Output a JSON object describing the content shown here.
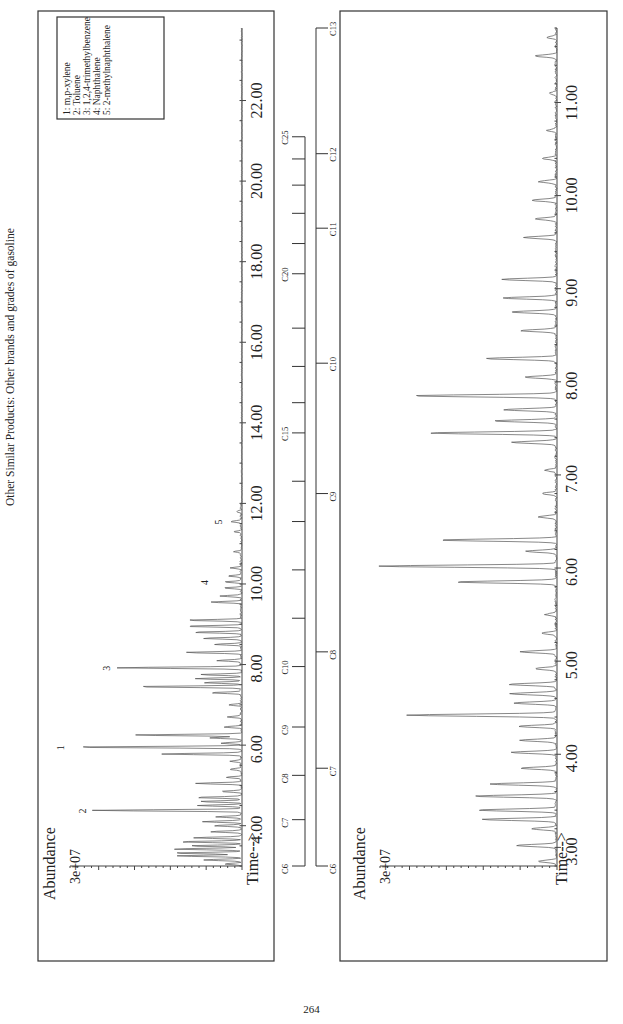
{
  "page": {
    "title": "Other Similar Products:   Other brands and grades of gasoline",
    "page_number": "264"
  },
  "chart_data": [
    {
      "type": "line",
      "id": "top-chromatogram",
      "title": "",
      "ylabel": "Abundance",
      "y_tick_label": "3e+07",
      "xlabel": "Time-->",
      "xlim": [
        3.0,
        23.8
      ],
      "x_ticks": [
        4.0,
        6.0,
        8.0,
        10.0,
        12.0,
        14.0,
        16.0,
        18.0,
        20.0,
        22.0
      ],
      "x_tick_labels": [
        "4.00",
        "6.00",
        "8.00",
        "10.00",
        "12.00",
        "14.00",
        "16.00",
        "18.00",
        "20.00",
        "22.00"
      ],
      "grid": false,
      "legend": {
        "position": "upper-left (rotated page)",
        "entries": [
          "1:  m,p-xylene",
          "2:  Toluene",
          "3:  1,2,4-trimethylbenzene",
          "4:  Naphthalene",
          "5:  2-methylnaphthalene"
        ]
      },
      "peak_annotations": [
        {
          "label": "1",
          "x": 5.95,
          "rel_height": 1.0
        },
        {
          "label": "2",
          "x": 4.38,
          "rel_height": 0.87
        },
        {
          "label": "3",
          "x": 7.92,
          "rel_height": 0.73
        },
        {
          "label": "4",
          "x": 10.05,
          "rel_height": 0.16
        },
        {
          "label": "5",
          "x": 11.55,
          "rel_height": 0.08
        }
      ],
      "peaks": [
        [
          3.05,
          0.1
        ],
        [
          3.15,
          0.22
        ],
        [
          3.25,
          0.38
        ],
        [
          3.32,
          0.4
        ],
        [
          3.42,
          0.4
        ],
        [
          3.5,
          0.3
        ],
        [
          3.6,
          0.36
        ],
        [
          3.7,
          0.28
        ],
        [
          3.85,
          0.18
        ],
        [
          4.0,
          0.16
        ],
        [
          4.1,
          0.22
        ],
        [
          4.22,
          0.15
        ],
        [
          4.38,
          0.87
        ],
        [
          4.5,
          0.25
        ],
        [
          4.6,
          0.24
        ],
        [
          4.7,
          0.27
        ],
        [
          4.85,
          0.12
        ],
        [
          5.05,
          0.27
        ],
        [
          5.2,
          0.09
        ],
        [
          5.4,
          0.07
        ],
        [
          5.6,
          0.06
        ],
        [
          5.78,
          0.46
        ],
        [
          5.95,
          1.0
        ],
        [
          6.05,
          0.12
        ],
        [
          6.18,
          0.18
        ],
        [
          6.25,
          0.63
        ],
        [
          6.45,
          0.1
        ],
        [
          6.7,
          0.08
        ],
        [
          7.0,
          0.07
        ],
        [
          7.3,
          0.18
        ],
        [
          7.45,
          0.62
        ],
        [
          7.55,
          0.22
        ],
        [
          7.65,
          0.27
        ],
        [
          7.75,
          0.24
        ],
        [
          7.92,
          0.73
        ],
        [
          8.1,
          0.14
        ],
        [
          8.3,
          0.33
        ],
        [
          8.5,
          0.16
        ],
        [
          8.65,
          0.22
        ],
        [
          8.8,
          0.28
        ],
        [
          8.95,
          0.33
        ],
        [
          9.1,
          0.32
        ],
        [
          9.55,
          0.18
        ],
        [
          9.7,
          0.12
        ],
        [
          9.9,
          0.1
        ],
        [
          10.05,
          0.1
        ],
        [
          10.2,
          0.08
        ],
        [
          10.4,
          0.06
        ],
        [
          10.8,
          0.04
        ],
        [
          11.3,
          0.04
        ],
        [
          11.55,
          0.06
        ],
        [
          11.8,
          0.03
        ]
      ]
    },
    {
      "type": "line",
      "id": "bottom-chromatogram-expanded",
      "title": "",
      "ylabel": "Abundance",
      "y_tick_label": "3e+07",
      "xlabel": "Time-->",
      "xlim": [
        2.8,
        11.8
      ],
      "x_ticks": [
        3.0,
        4.0,
        5.0,
        6.0,
        7.0,
        8.0,
        9.0,
        10.0,
        11.0
      ],
      "x_tick_labels": [
        "3.00",
        "4.00",
        "5.00",
        "6.00",
        "7.00",
        "8.00",
        "9.00",
        "10.00",
        "11.00"
      ],
      "grid": false,
      "peaks": [
        [
          2.85,
          0.1
        ],
        [
          3.02,
          0.22
        ],
        [
          3.2,
          0.14
        ],
        [
          3.3,
          0.42
        ],
        [
          3.4,
          0.44
        ],
        [
          3.55,
          0.46
        ],
        [
          3.68,
          0.37
        ],
        [
          3.85,
          0.2
        ],
        [
          4.02,
          0.25
        ],
        [
          4.15,
          0.2
        ],
        [
          4.3,
          0.21
        ],
        [
          4.42,
          0.84
        ],
        [
          4.55,
          0.24
        ],
        [
          4.65,
          0.26
        ],
        [
          4.75,
          0.27
        ],
        [
          4.92,
          0.12
        ],
        [
          5.1,
          0.2
        ],
        [
          5.3,
          0.08
        ],
        [
          5.5,
          0.06
        ],
        [
          5.85,
          0.57
        ],
        [
          6.02,
          1.0
        ],
        [
          6.18,
          0.17
        ],
        [
          6.3,
          0.66
        ],
        [
          6.55,
          0.1
        ],
        [
          6.8,
          0.08
        ],
        [
          7.05,
          0.06
        ],
        [
          7.35,
          0.25
        ],
        [
          7.45,
          0.72
        ],
        [
          7.58,
          0.35
        ],
        [
          7.7,
          0.3
        ],
        [
          7.85,
          0.81
        ],
        [
          8.05,
          0.18
        ],
        [
          8.25,
          0.4
        ],
        [
          8.55,
          0.2
        ],
        [
          8.75,
          0.26
        ],
        [
          8.9,
          0.3
        ],
        [
          9.1,
          0.31
        ],
        [
          9.55,
          0.18
        ],
        [
          9.75,
          0.12
        ],
        [
          9.95,
          0.14
        ],
        [
          10.15,
          0.1
        ],
        [
          10.4,
          0.08
        ],
        [
          10.7,
          0.05
        ],
        [
          11.1,
          0.04
        ],
        [
          11.5,
          0.12
        ],
        [
          11.7,
          0.05
        ]
      ]
    }
  ],
  "ladders": {
    "long_range": {
      "labels": [
        "C6",
        "C7",
        "C8",
        "C9",
        "C10",
        "C15",
        "C20",
        "C25"
      ],
      "label_times": {
        "C6": 3.0,
        "C7": 4.15,
        "C8": 5.25,
        "C9": 6.45,
        "C10": 7.95,
        "C15": 13.75,
        "C20": 17.7,
        "C25": 21.1
      },
      "minor_ticks": [
        9.15,
        10.35,
        11.55,
        12.55,
        14.5,
        15.4,
        16.35,
        18.45,
        19.2,
        19.9,
        20.55
      ]
    },
    "short_range": {
      "labels": [
        "C6",
        "C7",
        "C8",
        "C9",
        "C10",
        "C11",
        "C12",
        "C13"
      ],
      "label_times": {
        "C6": 2.8,
        "C7": 3.85,
        "C8": 5.1,
        "C9": 6.8,
        "C10": 8.2,
        "C11": 9.65,
        "C12": 10.45,
        "C13": 11.8
      }
    }
  }
}
